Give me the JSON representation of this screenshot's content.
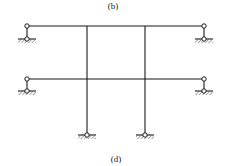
{
  "labels": {
    "top": "(b)",
    "bottom": "(d)"
  },
  "diagram": {
    "type": "structural frame",
    "beams": [
      {
        "name": "upper-beam",
        "y": 26,
        "x1": 27,
        "x2": 204
      },
      {
        "name": "lower-beam",
        "y": 79,
        "x1": 27,
        "x2": 204
      }
    ],
    "columns": [
      {
        "name": "left-column",
        "x": 87,
        "y1": 26,
        "y2": 135
      },
      {
        "name": "right-column",
        "x": 145,
        "y1": 26,
        "y2": 135
      }
    ],
    "hinges": [
      {
        "x": 27,
        "y": 26
      },
      {
        "x": 204,
        "y": 26
      },
      {
        "x": 27,
        "y": 79
      },
      {
        "x": 204,
        "y": 79
      }
    ],
    "supports": [
      {
        "x": 27,
        "y": 39,
        "type": "pin"
      },
      {
        "x": 204,
        "y": 39,
        "type": "pin"
      },
      {
        "x": 27,
        "y": 91,
        "type": "pin"
      },
      {
        "x": 204,
        "y": 91,
        "type": "pin"
      },
      {
        "x": 87,
        "y": 135,
        "type": "pin"
      },
      {
        "x": 145,
        "y": 135,
        "type": "pin"
      }
    ],
    "colors": {
      "line": "#1a1a1a",
      "hatch": "#555555",
      "background": "#ffffff"
    }
  }
}
